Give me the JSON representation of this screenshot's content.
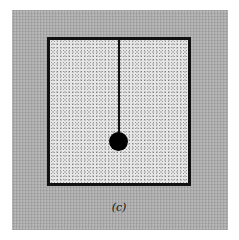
{
  "figure": {
    "label": "(c)",
    "elements": {
      "background": "gray textured field",
      "frame": "square with thick black border and stippled light fill",
      "string": "vertical line hanging from top border",
      "bob": "solid black circle"
    },
    "colors": {
      "background": "#a9a9a9",
      "frame_fill": "#e6e6e6",
      "border": "#111111",
      "bob": "#000000"
    }
  }
}
